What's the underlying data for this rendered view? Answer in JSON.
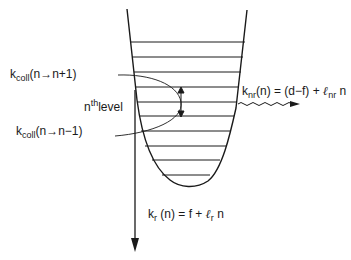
{
  "diagram": {
    "title": "",
    "well": {
      "type": "anharmonic potential well with vibrational levels",
      "levels_count": 10,
      "level_y": [
        42,
        57,
        72,
        87,
        102,
        116,
        131,
        146,
        160,
        175
      ],
      "stroke_color": "#1a1a1a"
    },
    "labels": {
      "kcoll_up": {
        "k": "k",
        "sub": "coll",
        "arg": "(n→n+1)"
      },
      "kcoll_down": {
        "k": "k",
        "sub": "coll",
        "arg": "(n→n−1)"
      },
      "nth_level": {
        "n": "n",
        "sup": "th",
        "rest": "level"
      },
      "knr": {
        "k": "k",
        "sub": "nr",
        "lhs_rest": "(n) = (d−f) + ",
        "l": "ℓ",
        "l_sub": "nr",
        "tail": " n"
      },
      "kr": {
        "k": "k",
        "sub": "r",
        "lhs_rest": " (n) = f + ",
        "l": "ℓ",
        "l_sub": "r",
        "tail": " n"
      }
    },
    "arrows": {
      "radiative": {
        "name": "radiative-decay-arrow",
        "direction": "down"
      },
      "nonradiative": {
        "name": "nonradiative-decay-wavy-arrow",
        "direction": "right"
      },
      "collisional": {
        "name": "collisional-transfer-double-arrow",
        "direction": "up-down"
      }
    }
  }
}
